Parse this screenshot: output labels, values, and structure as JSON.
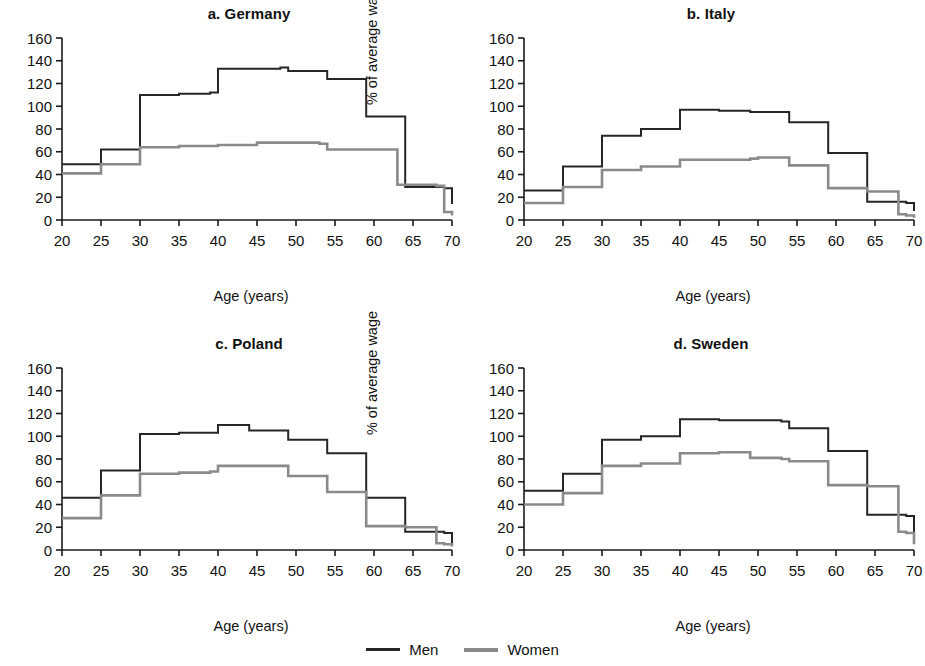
{
  "figure": {
    "title": "",
    "axis": {
      "xlabel": "Age (years)",
      "ylabel": "% of average wage",
      "xticks": [
        20,
        25,
        30,
        35,
        40,
        45,
        50,
        55,
        60,
        65,
        70
      ],
      "yticks": [
        0,
        20,
        40,
        60,
        80,
        100,
        120,
        140,
        160
      ],
      "xlim": [
        20,
        70
      ],
      "ylim": [
        0,
        160
      ]
    },
    "legend": {
      "position": "bottom-center",
      "entries": [
        {
          "label": "Men",
          "color": "#262626"
        },
        {
          "label": "Women",
          "color": "#8a8a8a"
        }
      ]
    },
    "colors": {
      "men": "#262626",
      "women": "#8a8a8a",
      "axis": "#1a1a1a",
      "background": "#ffffff"
    }
  },
  "panels": [
    {
      "key": "germany",
      "title": "a. Germany"
    },
    {
      "key": "italy",
      "title": "b. Italy"
    },
    {
      "key": "poland",
      "title": "c. Poland"
    },
    {
      "key": "sweden",
      "title": "d. Sweden"
    }
  ],
  "chart_data": [
    {
      "type": "line",
      "title": "a. Germany",
      "xlabel": "Age (years)",
      "ylabel": "% of average wage",
      "xlim": [
        20,
        70
      ],
      "ylim": [
        0,
        160
      ],
      "xticks": [
        20,
        25,
        30,
        35,
        40,
        45,
        50,
        55,
        60,
        65,
        70
      ],
      "yticks": [
        0,
        20,
        40,
        60,
        80,
        100,
        120,
        140,
        160
      ],
      "grid": false,
      "step": "post",
      "x": [
        20,
        24,
        25,
        29,
        30,
        34,
        35,
        38,
        39,
        40,
        44,
        45,
        48,
        49,
        53,
        54,
        58,
        59,
        63,
        64,
        68,
        69,
        70
      ],
      "series": [
        {
          "name": "Men",
          "values": [
            49,
            49,
            62,
            62,
            110,
            110,
            111,
            111,
            112,
            133,
            133,
            133,
            134,
            131,
            131,
            124,
            124,
            91,
            91,
            29,
            29,
            28,
            14
          ]
        },
        {
          "name": "Women",
          "values": [
            41,
            41,
            49,
            49,
            64,
            64,
            65,
            65,
            65,
            66,
            66,
            68,
            68,
            68,
            67,
            62,
            62,
            62,
            31,
            31,
            30,
            7,
            4
          ]
        }
      ]
    },
    {
      "type": "line",
      "title": "b. Italy",
      "xlabel": "Age (years)",
      "ylabel": "% of average wage",
      "xlim": [
        20,
        70
      ],
      "ylim": [
        0,
        160
      ],
      "xticks": [
        20,
        25,
        30,
        35,
        40,
        45,
        50,
        55,
        60,
        65,
        70
      ],
      "yticks": [
        0,
        20,
        40,
        60,
        80,
        100,
        120,
        140,
        160
      ],
      "grid": false,
      "step": "post",
      "x": [
        20,
        24,
        25,
        29,
        30,
        34,
        35,
        39,
        40,
        44,
        45,
        49,
        50,
        53,
        54,
        58,
        59,
        63,
        64,
        68,
        69,
        70
      ],
      "series": [
        {
          "name": "Men",
          "values": [
            26,
            26,
            47,
            47,
            74,
            74,
            80,
            80,
            97,
            97,
            96,
            95,
            95,
            95,
            86,
            86,
            59,
            59,
            16,
            16,
            15,
            8
          ]
        },
        {
          "name": "Women",
          "values": [
            15,
            15,
            29,
            29,
            44,
            44,
            47,
            47,
            53,
            53,
            53,
            54,
            55,
            55,
            48,
            48,
            28,
            28,
            25,
            5,
            4,
            2
          ]
        }
      ]
    },
    {
      "type": "line",
      "title": "c. Poland",
      "xlabel": "Age (years)",
      "ylabel": "% of average wage",
      "xlim": [
        20,
        70
      ],
      "ylim": [
        0,
        160
      ],
      "xticks": [
        20,
        25,
        30,
        35,
        40,
        45,
        50,
        55,
        60,
        65,
        70
      ],
      "yticks": [
        0,
        20,
        40,
        60,
        80,
        100,
        120,
        140,
        160
      ],
      "grid": false,
      "step": "post",
      "x": [
        20,
        24,
        25,
        29,
        30,
        34,
        35,
        38,
        39,
        40,
        43,
        44,
        48,
        49,
        53,
        54,
        58,
        59,
        63,
        64,
        68,
        69,
        70
      ],
      "series": [
        {
          "name": "Men",
          "values": [
            46,
            46,
            70,
            70,
            102,
            102,
            103,
            103,
            103,
            110,
            110,
            105,
            105,
            97,
            97,
            85,
            85,
            46,
            46,
            16,
            16,
            15,
            6
          ]
        },
        {
          "name": "Women",
          "values": [
            28,
            28,
            48,
            48,
            67,
            67,
            68,
            68,
            69,
            74,
            74,
            74,
            74,
            65,
            65,
            51,
            51,
            21,
            21,
            20,
            6,
            5,
            3
          ]
        }
      ]
    },
    {
      "type": "line",
      "title": "d. Sweden",
      "xlabel": "Age (years)",
      "ylabel": "% of average wage",
      "xlim": [
        20,
        70
      ],
      "ylim": [
        0,
        160
      ],
      "xticks": [
        20,
        25,
        30,
        35,
        40,
        45,
        50,
        55,
        60,
        65,
        70
      ],
      "yticks": [
        0,
        20,
        40,
        60,
        80,
        100,
        120,
        140,
        160
      ],
      "grid": false,
      "step": "post",
      "x": [
        20,
        24,
        25,
        29,
        30,
        34,
        35,
        39,
        40,
        44,
        45,
        48,
        49,
        53,
        54,
        58,
        59,
        63,
        64,
        68,
        69,
        70
      ],
      "series": [
        {
          "name": "Men",
          "values": [
            52,
            52,
            67,
            67,
            97,
            97,
            100,
            100,
            115,
            115,
            114,
            114,
            114,
            113,
            107,
            107,
            87,
            87,
            31,
            31,
            30,
            15
          ]
        },
        {
          "name": "Women",
          "values": [
            40,
            40,
            50,
            50,
            74,
            74,
            76,
            76,
            85,
            85,
            86,
            86,
            81,
            80,
            78,
            78,
            57,
            57,
            56,
            16,
            15,
            5
          ]
        }
      ]
    }
  ]
}
